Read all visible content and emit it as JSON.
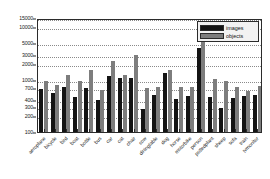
{
  "chart_data": {
    "type": "bar",
    "title": "",
    "xlabel": "",
    "ylabel": "",
    "yscale": "log",
    "ylim": [
      100,
      15000
    ],
    "grid": true,
    "legend_position": "top-right",
    "yticks": [
      100,
      200,
      300,
      400,
      700,
      1000,
      2000,
      3000,
      5000,
      10000,
      15000
    ],
    "ytick_labels": [
      "100",
      "200",
      "300",
      "400",
      "700",
      "1000",
      "2000",
      "3000",
      "5000",
      "10000",
      "15000"
    ],
    "categories": [
      "aeroplane",
      "bicycle",
      "bird",
      "boat",
      "bottle",
      "bus",
      "car",
      "cat",
      "chair",
      "cow",
      "diningtable",
      "dog",
      "horse",
      "motorbike",
      "person",
      "pottedplant",
      "sheep",
      "sofa",
      "train",
      "tvmonitor"
    ],
    "series": [
      {
        "name": "images",
        "color": "#141414",
        "values": [
          670,
          550,
          730,
          470,
          690,
          400,
          1160,
          1080,
          1080,
          270,
          510,
          1320,
          430,
          480,
          4000,
          470,
          290,
          450,
          490,
          520
        ]
      },
      {
        "name": "objects",
        "color": "#7d7d7d",
        "values": [
          950,
          780,
          1250,
          950,
          1540,
          630,
          2300,
          1230,
          2900,
          700,
          710,
          1550,
          710,
          710,
          10000,
          1050,
          950,
          710,
          600,
          770
        ]
      }
    ]
  },
  "legend": {
    "entries": [
      {
        "label": "images",
        "color": "#141414"
      },
      {
        "label": "objects",
        "color": "#7d7d7d"
      }
    ]
  }
}
